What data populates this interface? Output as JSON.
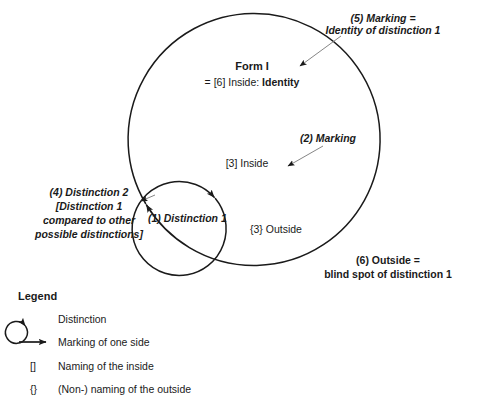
{
  "diagram": {
    "title_block": {
      "form_title": "Form I",
      "form_subtitle_prefix": "= [6] Inside: ",
      "form_subtitle_bold": "Identity"
    },
    "inner_circle_label": "[3] Inside",
    "outer_region_label": "{3} Outside",
    "annotations": {
      "a1": "(1) Distinction 1",
      "a2": "(2) Marking",
      "a4_line1": "(4) Distinction 2",
      "a4_line2": "[Distinction 1",
      "a4_line3": "compared to other",
      "a4_line4": "possible distinctions]",
      "a5_line1": "(5) Marking =",
      "a5_line2": "Identity of distinction 1",
      "a6_line1": "(6) Outside =",
      "a6_line2": "blind spot of distinction 1"
    }
  },
  "legend": {
    "title": "Legend",
    "items": [
      {
        "symbol": "circle-with-arrow",
        "label": "Distinction"
      },
      {
        "symbol": "arrow-right",
        "label": "Marking of one side"
      },
      {
        "symbol": "[]",
        "label": "Naming of the inside"
      },
      {
        "symbol": "{}",
        "label": "(Non-) naming of the outside"
      }
    ]
  },
  "colors": {
    "stroke": "#1a1a1a",
    "thin_stroke": "#555555",
    "background": "#ffffff"
  }
}
